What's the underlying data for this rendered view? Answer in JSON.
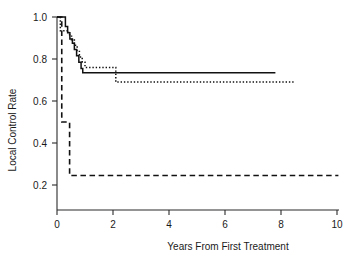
{
  "chart_data": {
    "type": "line",
    "title": "",
    "xlabel": "Years From First Treatment",
    "ylabel": "Local Control Rate",
    "xlim": [
      0,
      10.3
    ],
    "ylim": [
      0.0,
      1.03
    ],
    "grid": false,
    "legend": "none",
    "xticks": [
      0,
      2,
      4,
      6,
      8,
      10
    ],
    "xtick_labels": [
      "0",
      "2",
      "4",
      "6",
      "8",
      "10"
    ],
    "yticks": [
      0.2,
      0.4,
      0.6,
      0.8,
      1.0
    ],
    "ytick_labels": [
      "0.2",
      "0.4",
      "0.6",
      "0.8",
      "1.0"
    ],
    "step_style": "post",
    "series": [
      {
        "name": "curve-solid",
        "line_style": "solid",
        "color": "#111111",
        "x": [
          0.0,
          0.17,
          0.3,
          0.38,
          0.46,
          0.55,
          0.62,
          0.7,
          0.78,
          0.86,
          0.92,
          7.8
        ],
        "y": [
          1.0,
          1.0,
          0.955,
          0.925,
          0.895,
          0.875,
          0.845,
          0.815,
          0.785,
          0.755,
          0.735,
          0.735
        ]
      },
      {
        "name": "curve-dotted",
        "line_style": "dotted",
        "color": "#111111",
        "x": [
          0.0,
          0.12,
          0.33,
          0.42,
          0.52,
          0.62,
          0.72,
          0.8,
          0.9,
          1.0,
          2.1,
          8.5
        ],
        "y": [
          1.0,
          0.935,
          0.935,
          0.915,
          0.89,
          0.865,
          0.84,
          0.81,
          0.785,
          0.76,
          0.69,
          0.69
        ]
      },
      {
        "name": "curve-dashed",
        "line_style": "dashed",
        "color": "#111111",
        "x": [
          0.0,
          0.17,
          0.45,
          10.05
        ],
        "y": [
          1.0,
          0.5,
          0.245,
          0.245
        ]
      }
    ]
  }
}
